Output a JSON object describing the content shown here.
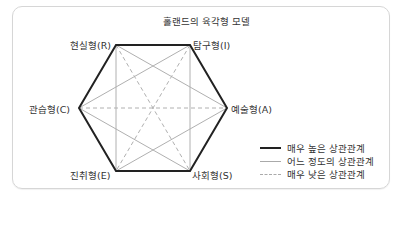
{
  "diagram": {
    "title": "홀랜드의 육각형 모델",
    "nodes": [
      {
        "id": "R",
        "label": "현실형(R)",
        "x": 116,
        "y": 45
      },
      {
        "id": "I",
        "label": "탐구형(I)",
        "x": 190,
        "y": 45
      },
      {
        "id": "A",
        "label": "예술형(A)",
        "x": 227,
        "y": 108
      },
      {
        "id": "S",
        "label": "사회형(S)",
        "x": 190,
        "y": 171
      },
      {
        "id": "E",
        "label": "진취형(E)",
        "x": 116,
        "y": 171
      },
      {
        "id": "C",
        "label": "관습형(C)",
        "x": 79,
        "y": 108
      }
    ],
    "edges": {
      "very_high": [
        [
          "R",
          "I"
        ],
        [
          "I",
          "A"
        ],
        [
          "A",
          "S"
        ],
        [
          "S",
          "E"
        ],
        [
          "E",
          "C"
        ],
        [
          "C",
          "R"
        ]
      ],
      "moderate": [
        [
          "R",
          "E"
        ],
        [
          "I",
          "S"
        ],
        [
          "R",
          "S"
        ],
        [
          "I",
          "E"
        ],
        [
          "C",
          "I"
        ],
        [
          "C",
          "S"
        ],
        [
          "A",
          "E"
        ],
        [
          "A",
          "R"
        ]
      ],
      "very_low": [
        [
          "R",
          "S"
        ],
        [
          "I",
          "E"
        ],
        [
          "C",
          "A"
        ]
      ]
    },
    "colors": {
      "very_high": "#222222",
      "moderate": "#aaaaaa",
      "very_low": "#aaaaaa"
    }
  },
  "legend": {
    "items": [
      {
        "style": "solid-thick",
        "label": "매우 높은 상관관계"
      },
      {
        "style": "solid-thin",
        "label": "어느 정도의 상관관계"
      },
      {
        "style": "dashed",
        "label": "매우 낮은 상관관계"
      }
    ]
  }
}
